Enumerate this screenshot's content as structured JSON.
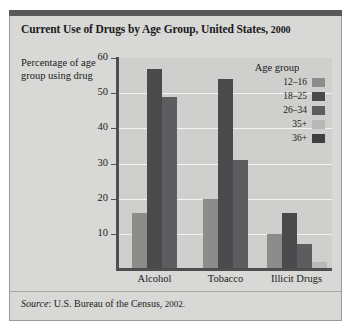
{
  "figure": {
    "title": "Current Use of Drugs by Age Group, United States, 2000",
    "title_main": "Current Use of Drugs by Age Group, United States,",
    "title_year": "2000",
    "source_prefix": "Source",
    "source_text": ": U.S. Bureau of the Census,",
    "source_year": "2002."
  },
  "legend": {
    "title": "Age group",
    "position": "inside-top-right",
    "entries": [
      {
        "label": "12–16",
        "color": "#8c8c8a"
      },
      {
        "label": "18–25",
        "color": "#4a4a4c"
      },
      {
        "label": "26–34",
        "color": "#5d5d5f"
      },
      {
        "label": "35+",
        "color": "#b8b8b6"
      },
      {
        "label": "36+",
        "color": "#3f3f41"
      }
    ]
  },
  "chart_data": {
    "type": "bar",
    "title": "Current Use of Drugs by Age Group, United States, 2000",
    "xlabel": "",
    "ylabel": "Percentage of age group using drug",
    "ylim": [
      0,
      60
    ],
    "yticks": [
      10,
      20,
      30,
      40,
      50,
      60
    ],
    "grid": true,
    "categories": [
      "Alcohol",
      "Tobacco",
      "Illicit Drugs"
    ],
    "series": [
      {
        "name": "12–16",
        "color": "#8c8c8a",
        "values": [
          16,
          20,
          10
        ]
      },
      {
        "name": "18–25",
        "color": "#4a4a4c",
        "values": [
          57,
          54,
          16
        ]
      },
      {
        "name": "26–34",
        "color": "#5d5d5f",
        "values": [
          49,
          31,
          7
        ]
      },
      {
        "name": "35+",
        "color": "#b8b8b6",
        "values": [
          null,
          null,
          2
        ]
      },
      {
        "name": "36+",
        "color": "#3f3f41",
        "values": [
          null,
          null,
          null
        ]
      }
    ]
  }
}
